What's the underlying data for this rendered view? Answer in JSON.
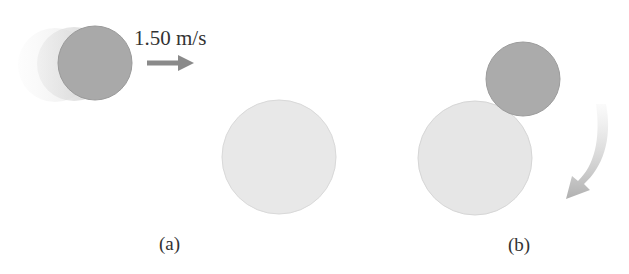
{
  "figure": {
    "panel_a": {
      "label": "(a)",
      "velocity_label": "1.50 m/s",
      "moving_ball": {
        "role": "small-ball",
        "color": "#a9a9a9"
      },
      "stationary_ball": {
        "role": "large-ball",
        "color": "#e8e8e8"
      },
      "arrow_color": "#8a8a8a"
    },
    "panel_b": {
      "label": "(b)",
      "small_ball": {
        "color": "#ababab"
      },
      "large_ball": {
        "color": "#e6e6e6"
      },
      "rotation_arrow_color": "#b4b4b4"
    }
  }
}
